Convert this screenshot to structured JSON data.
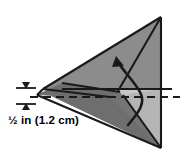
{
  "figure": {
    "name": "pyramid-cross-section-diagram",
    "type": "geometric-solid",
    "dimension_label": "½ in (1.2 cm)",
    "colors": {
      "outline": "#1a1a1a",
      "face_top_left": "#8c8c8c",
      "face_right_light": "#c8c8c8",
      "face_lower": "#757575",
      "face_base_dark": "#6e6e6e",
      "background": "#ffffff",
      "label_text": "#000000"
    },
    "annotations": {
      "cut_plane_style": "dashed-horizontal-line",
      "height_marker": "double-headed-vertical-arrow",
      "rotation_marker": "curved-arrow-pointing-up"
    }
  }
}
